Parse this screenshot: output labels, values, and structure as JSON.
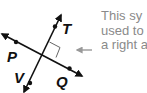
{
  "diagram": {
    "lines": [
      {
        "name": "line-TV",
        "points": [
          "T",
          "V"
        ]
      },
      {
        "name": "line-PQ",
        "points": [
          "P",
          "Q"
        ]
      }
    ],
    "points": {
      "T": {
        "label": "T"
      },
      "V": {
        "label": "V"
      },
      "P": {
        "label": "P"
      },
      "Q": {
        "label": "Q"
      }
    },
    "right_angle_marker": true,
    "colors": {
      "line": "#111111",
      "annotation": "#999999",
      "caption": "#8a8a8a"
    }
  },
  "caption": {
    "lines": [
      "This sy",
      "used to",
      "a right a"
    ]
  }
}
